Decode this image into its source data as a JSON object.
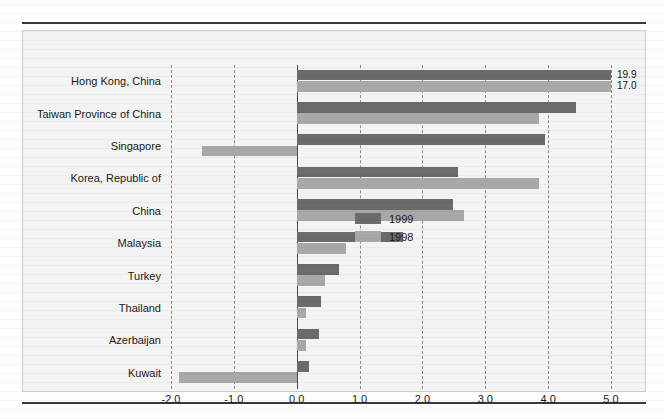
{
  "chart_data": {
    "type": "bar",
    "orientation": "horizontal",
    "title": "",
    "subtitle": "",
    "xlabel": "",
    "ylabel": "",
    "xlim": [
      -2.0,
      5.0
    ],
    "xticks": [
      "-2.0",
      "-1.0",
      "0.0",
      "1.0",
      "2.0",
      "3.0",
      "4.0",
      "5.0"
    ],
    "xtick_values": [
      -2.0,
      -1.0,
      0.0,
      1.0,
      2.0,
      3.0,
      4.0,
      5.0
    ],
    "grid": "vertical-dashed",
    "legend_position": "middle-right-inside",
    "categories": [
      "Hong Kong, China",
      "Taiwan Province of China",
      "Singapore",
      "Korea, Republic of",
      "China",
      "Malaysia",
      "Turkey",
      "Thailand",
      "Azerbaijan",
      "Kuwait"
    ],
    "series": [
      {
        "name": "1999",
        "color": "#6b6b6b",
        "values": [
          19.9,
          4.45,
          3.95,
          2.56,
          2.49,
          1.69,
          0.68,
          0.38,
          0.36,
          0.19
        ]
      },
      {
        "name": "1998",
        "color": "#a8a8a8",
        "values": [
          17.0,
          3.86,
          -1.5,
          3.86,
          2.66,
          0.79,
          0.45,
          0.15,
          0.15,
          -1.88
        ]
      }
    ],
    "annotations": [
      {
        "category": "Hong Kong, China",
        "series": "1999",
        "label": "19.9",
        "note": "bar clipped at axis maximum"
      },
      {
        "category": "Hong Kong, China",
        "series": "1998",
        "label": "17.0",
        "note": "bar clipped at axis maximum"
      }
    ]
  },
  "legend": {
    "items": [
      {
        "label": "1999",
        "color": "#6b6b6b"
      },
      {
        "label": "1998",
        "color": "#a8a8a8"
      }
    ]
  },
  "colors": {
    "series_1999": "#6b6b6b",
    "series_1998": "#a8a8a8",
    "plot_background": "#f3f3f3",
    "gridline": "#8a8a8a",
    "zero_line": "#4a4a4a",
    "rule": "#3a3a3a",
    "text": "#1a1a1a"
  }
}
